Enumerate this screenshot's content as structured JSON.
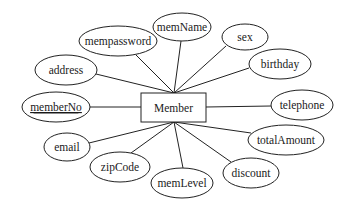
{
  "diagram": {
    "type": "er-diagram",
    "entity": {
      "id": "member",
      "label": "Member",
      "x": 141,
      "y": 93,
      "w": 65,
      "h": 29
    },
    "attributes": [
      {
        "id": "mempassword",
        "label": "mempassword",
        "cx": 118,
        "cy": 41,
        "rx": 39,
        "ry": 15,
        "key": false
      },
      {
        "id": "memName",
        "label": "memName",
        "cx": 182,
        "cy": 27,
        "rx": 29,
        "ry": 14,
        "key": false
      },
      {
        "id": "sex",
        "label": "sex",
        "cx": 245,
        "cy": 37,
        "rx": 23,
        "ry": 13,
        "key": false
      },
      {
        "id": "birthday",
        "label": "birthday",
        "cx": 280,
        "cy": 64,
        "rx": 31,
        "ry": 15,
        "key": false
      },
      {
        "id": "address",
        "label": "address",
        "cx": 66,
        "cy": 70,
        "rx": 31,
        "ry": 15,
        "key": false
      },
      {
        "id": "memberNo",
        "label": "memberNo",
        "cx": 56,
        "cy": 107,
        "rx": 34,
        "ry": 15,
        "key": true
      },
      {
        "id": "telephone",
        "label": "telephone",
        "cx": 302,
        "cy": 105,
        "rx": 31,
        "ry": 15,
        "key": false
      },
      {
        "id": "email",
        "label": "email",
        "cx": 67,
        "cy": 147,
        "rx": 23,
        "ry": 14,
        "key": false
      },
      {
        "id": "totalAmount",
        "label": "totalAmount",
        "cx": 286,
        "cy": 140,
        "rx": 38,
        "ry": 15,
        "key": false
      },
      {
        "id": "zipCode",
        "label": "zipCode",
        "cx": 120,
        "cy": 167,
        "rx": 30,
        "ry": 15,
        "key": false
      },
      {
        "id": "discount",
        "label": "discount",
        "cx": 251,
        "cy": 173,
        "rx": 28,
        "ry": 15,
        "key": false
      },
      {
        "id": "memLevel",
        "label": "memLevel",
        "cx": 182,
        "cy": 183,
        "rx": 31,
        "ry": 15,
        "key": false
      }
    ],
    "edges": [
      {
        "from": "member",
        "to": "mempassword",
        "x1": 174,
        "y1": 93,
        "x2": 136,
        "y2": 55
      },
      {
        "from": "member",
        "to": "memName",
        "x1": 174,
        "y1": 93,
        "x2": 181,
        "y2": 41
      },
      {
        "from": "member",
        "to": "sex",
        "x1": 174,
        "y1": 93,
        "x2": 226,
        "y2": 46
      },
      {
        "from": "member",
        "to": "birthday",
        "x1": 174,
        "y1": 93,
        "x2": 249,
        "y2": 68
      },
      {
        "from": "member",
        "to": "address",
        "x1": 174,
        "y1": 93,
        "x2": 96,
        "y2": 74
      },
      {
        "from": "member",
        "to": "memberNo",
        "x1": 141,
        "y1": 107,
        "x2": 90,
        "y2": 107
      },
      {
        "from": "member",
        "to": "telephone",
        "x1": 206,
        "y1": 107,
        "x2": 271,
        "y2": 106
      },
      {
        "from": "member",
        "to": "email",
        "x1": 174,
        "y1": 122,
        "x2": 89,
        "y2": 143
      },
      {
        "from": "member",
        "to": "totalAmount",
        "x1": 174,
        "y1": 122,
        "x2": 251,
        "y2": 133
      },
      {
        "from": "member",
        "to": "zipCode",
        "x1": 174,
        "y1": 122,
        "x2": 131,
        "y2": 153
      },
      {
        "from": "member",
        "to": "discount",
        "x1": 174,
        "y1": 122,
        "x2": 231,
        "y2": 162
      },
      {
        "from": "member",
        "to": "memLevel",
        "x1": 174,
        "y1": 122,
        "x2": 183,
        "y2": 168
      }
    ]
  }
}
